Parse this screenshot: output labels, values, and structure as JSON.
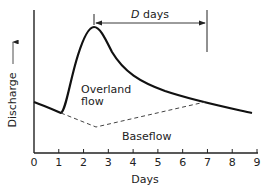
{
  "diagram": {
    "y_axis_label": "Discharge",
    "x_axis_label": "Days",
    "x_ticks": [
      "0",
      "1",
      "2",
      "3",
      "4",
      "5",
      "6",
      "7",
      "8",
      "9"
    ],
    "annotation_italic": "D",
    "annotation_rest": " days",
    "overland_label_line1": "Overland",
    "overland_label_line2": "flow",
    "baseflow_label": "Baseflow"
  }
}
